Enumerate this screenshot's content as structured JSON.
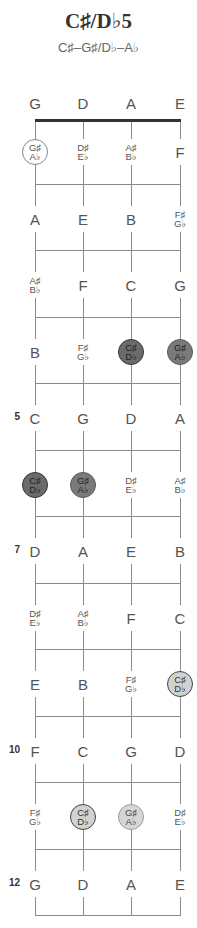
{
  "title": "C♯/D♭5",
  "subtitle": "C♯–G♯/D♭–A♭",
  "layout": {
    "string_x": [
      35,
      83,
      131,
      180
    ],
    "nut_y": 121,
    "fret_spacing": 66.5,
    "fret_count": 12
  },
  "colors": {
    "root_dark": "#6b6b6b",
    "fifth_dark": "#7a7a7a",
    "root_light": "#d2d2d2",
    "fifth_light": "#d6d6d6",
    "line": "#8a8a8a",
    "nut": "#333333"
  },
  "open_strings": [
    "G",
    "D",
    "A",
    "E"
  ],
  "fret_markers": [
    {
      "fret": 5,
      "label": "5"
    },
    {
      "fret": 7,
      "label": "7"
    },
    {
      "fret": 10,
      "label": "10"
    },
    {
      "fret": 12,
      "label": "12"
    }
  ],
  "frets": [
    {
      "fret": 1,
      "notes": [
        {
          "label": [
            "G♯",
            "A♭"
          ],
          "style": "outline"
        },
        {
          "label": [
            "D♯",
            "E♭"
          ],
          "style": "plain"
        },
        {
          "label": [
            "A♯",
            "B♭"
          ],
          "style": "plain"
        },
        {
          "label": [
            "F"
          ],
          "style": "plain"
        }
      ]
    },
    {
      "fret": 2,
      "notes": [
        {
          "label": [
            "A"
          ],
          "style": "plain"
        },
        {
          "label": [
            "E"
          ],
          "style": "plain"
        },
        {
          "label": [
            "B"
          ],
          "style": "plain"
        },
        {
          "label": [
            "F♯",
            "G♭"
          ],
          "style": "plain"
        }
      ]
    },
    {
      "fret": 3,
      "notes": [
        {
          "label": [
            "A♯",
            "B♭"
          ],
          "style": "plain"
        },
        {
          "label": [
            "F"
          ],
          "style": "plain"
        },
        {
          "label": [
            "C"
          ],
          "style": "plain"
        },
        {
          "label": [
            "G"
          ],
          "style": "plain"
        }
      ]
    },
    {
      "fret": 4,
      "notes": [
        {
          "label": [
            "B"
          ],
          "style": "plain"
        },
        {
          "label": [
            "F♯",
            "G♭"
          ],
          "style": "plain"
        },
        {
          "label": [
            "C♯",
            "D♭"
          ],
          "style": "root-dark"
        },
        {
          "label": [
            "G♯",
            "A♭"
          ],
          "style": "fifth-dark"
        }
      ]
    },
    {
      "fret": 5,
      "notes": [
        {
          "label": [
            "C"
          ],
          "style": "plain"
        },
        {
          "label": [
            "G"
          ],
          "style": "plain"
        },
        {
          "label": [
            "D"
          ],
          "style": "plain"
        },
        {
          "label": [
            "A"
          ],
          "style": "plain"
        }
      ]
    },
    {
      "fret": 6,
      "notes": [
        {
          "label": [
            "C♯",
            "D♭"
          ],
          "style": "root-dark"
        },
        {
          "label": [
            "G♯",
            "A♭"
          ],
          "style": "fifth-dark"
        },
        {
          "label": [
            "D♯",
            "E♭"
          ],
          "style": "plain"
        },
        {
          "label": [
            "A♯",
            "B♭"
          ],
          "style": "plain"
        }
      ]
    },
    {
      "fret": 7,
      "notes": [
        {
          "label": [
            "D"
          ],
          "style": "plain"
        },
        {
          "label": [
            "A"
          ],
          "style": "plain"
        },
        {
          "label": [
            "E"
          ],
          "style": "plain"
        },
        {
          "label": [
            "B"
          ],
          "style": "plain"
        }
      ]
    },
    {
      "fret": 8,
      "notes": [
        {
          "label": [
            "D♯",
            "E♭"
          ],
          "style": "plain"
        },
        {
          "label": [
            "A♯",
            "B♭"
          ],
          "style": "plain"
        },
        {
          "label": [
            "F"
          ],
          "style": "plain"
        },
        {
          "label": [
            "C"
          ],
          "style": "plain"
        }
      ]
    },
    {
      "fret": 9,
      "notes": [
        {
          "label": [
            "E"
          ],
          "style": "plain"
        },
        {
          "label": [
            "B"
          ],
          "style": "plain"
        },
        {
          "label": [
            "F♯",
            "G♭"
          ],
          "style": "plain"
        },
        {
          "label": [
            "C♯",
            "D♭"
          ],
          "style": "root-light"
        }
      ]
    },
    {
      "fret": 10,
      "notes": [
        {
          "label": [
            "F"
          ],
          "style": "plain"
        },
        {
          "label": [
            "C"
          ],
          "style": "plain"
        },
        {
          "label": [
            "G"
          ],
          "style": "plain"
        },
        {
          "label": [
            "D"
          ],
          "style": "plain"
        }
      ]
    },
    {
      "fret": 11,
      "notes": [
        {
          "label": [
            "F♯",
            "G♭"
          ],
          "style": "plain"
        },
        {
          "label": [
            "C♯",
            "D♭"
          ],
          "style": "root-light"
        },
        {
          "label": [
            "G♯",
            "A♭"
          ],
          "style": "fifth-light"
        },
        {
          "label": [
            "D♯",
            "E♭"
          ],
          "style": "plain"
        }
      ]
    },
    {
      "fret": 12,
      "notes": [
        {
          "label": [
            "G"
          ],
          "style": "plain"
        },
        {
          "label": [
            "D"
          ],
          "style": "plain"
        },
        {
          "label": [
            "A"
          ],
          "style": "plain"
        },
        {
          "label": [
            "E"
          ],
          "style": "plain"
        }
      ]
    }
  ]
}
